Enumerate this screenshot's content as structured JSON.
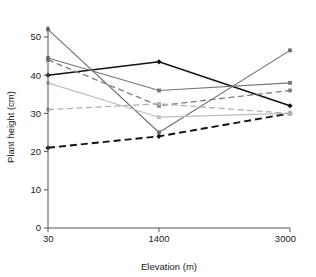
{
  "chart_data": {
    "type": "line",
    "title": "",
    "xlabel": "Elevation (m)",
    "ylabel": "Plant height (cm)",
    "categories": [
      "30",
      "1400",
      "3000"
    ],
    "x": [
      30,
      1400,
      3000
    ],
    "x_tick_labels": [
      "30",
      "1400",
      "3000"
    ],
    "y_tick_labels": [
      "0",
      "10",
      "20",
      "30",
      "40",
      "50"
    ],
    "y_ticks": [
      0,
      10,
      20,
      30,
      40,
      50
    ],
    "ylim": [
      0,
      54
    ],
    "grid": false,
    "legend": "none",
    "series": [
      {
        "name": "series-1",
        "values": [
          40.0,
          43.5,
          32.0
        ],
        "color": "#111111",
        "style": "solid",
        "width": 1.6,
        "marker": "diamond"
      },
      {
        "name": "series-2",
        "values": [
          21.0,
          24.0,
          30.0
        ],
        "color": "#111111",
        "style": "dashed",
        "width": 1.9,
        "marker": "diamond"
      },
      {
        "name": "series-3",
        "values": [
          52.0,
          25.0,
          46.5
        ],
        "color": "#6d6d6d",
        "style": "solid",
        "width": 1.1,
        "marker": "square"
      },
      {
        "name": "series-4",
        "values": [
          44.5,
          36.0,
          38.0
        ],
        "color": "#757575",
        "style": "solid",
        "width": 1.2,
        "marker": "square"
      },
      {
        "name": "series-5",
        "values": [
          44.0,
          32.0,
          36.0
        ],
        "color": "#7e7e7e",
        "style": "dashed",
        "width": 1.3,
        "marker": "square"
      },
      {
        "name": "series-6",
        "values": [
          38.0,
          29.0,
          30.0
        ],
        "color": "#bdbdbd",
        "style": "solid",
        "width": 1.2,
        "marker": "square"
      },
      {
        "name": "series-7",
        "values": [
          31.0,
          32.5,
          30.0
        ],
        "color": "#b0b0b0",
        "style": "dashed",
        "width": 1.3,
        "marker": "square"
      }
    ]
  },
  "axes": {
    "x_label": "Elevation (m)",
    "y_label": "Plant height (cm)",
    "x_ticks": [
      "30",
      "1400",
      "3000"
    ],
    "y_ticks": [
      "0",
      "10",
      "20",
      "30",
      "40",
      "50"
    ]
  }
}
